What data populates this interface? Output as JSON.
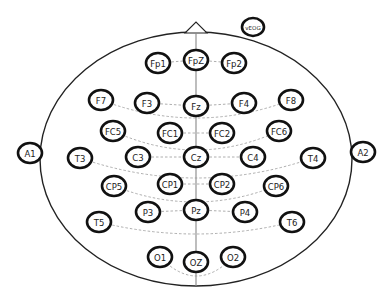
{
  "diagram": {
    "head": {
      "cx": 196,
      "cy": 159,
      "rx": 156,
      "ry": 127
    },
    "nose": {
      "apex": [
        196,
        22
      ],
      "left": [
        185,
        33
      ],
      "right": [
        207,
        33
      ]
    },
    "colors": {
      "ring": "#111111",
      "text": "#222222",
      "outline": "#222222",
      "connector": "#999999",
      "background": "#ffffff"
    },
    "electrodes": [
      {
        "id": "vEOG",
        "label": "vEOG",
        "x": 253,
        "y": 27,
        "rx": 11,
        "ry": 9,
        "small": true
      },
      {
        "id": "Fp1",
        "label": "Fp1",
        "x": 158,
        "y": 63
      },
      {
        "id": "FpZ",
        "label": "FpZ",
        "x": 196,
        "y": 60
      },
      {
        "id": "Fp2",
        "label": "Fp2",
        "x": 234,
        "y": 63
      },
      {
        "id": "F7",
        "label": "F7",
        "x": 101,
        "y": 100
      },
      {
        "id": "F3",
        "label": "F3",
        "x": 147,
        "y": 103
      },
      {
        "id": "Fz",
        "label": "Fz",
        "x": 196,
        "y": 106
      },
      {
        "id": "F4",
        "label": "F4",
        "x": 244,
        "y": 103
      },
      {
        "id": "F8",
        "label": "F8",
        "x": 291,
        "y": 100
      },
      {
        "id": "FC5",
        "label": "FC5",
        "x": 113,
        "y": 131
      },
      {
        "id": "FC1",
        "label": "FC1",
        "x": 170,
        "y": 133
      },
      {
        "id": "FC2",
        "label": "FC2",
        "x": 222,
        "y": 133
      },
      {
        "id": "FC6",
        "label": "FC6",
        "x": 279,
        "y": 131
      },
      {
        "id": "A1",
        "label": "A1",
        "x": 30,
        "y": 153
      },
      {
        "id": "T3",
        "label": "T3",
        "x": 80,
        "y": 158
      },
      {
        "id": "C3",
        "label": "C3",
        "x": 138,
        "y": 157
      },
      {
        "id": "Cz",
        "label": "Cz",
        "x": 196,
        "y": 157
      },
      {
        "id": "C4",
        "label": "C4",
        "x": 253,
        "y": 157
      },
      {
        "id": "T4",
        "label": "T4",
        "x": 313,
        "y": 158
      },
      {
        "id": "A2",
        "label": "A2",
        "x": 363,
        "y": 152
      },
      {
        "id": "CP5",
        "label": "CP5",
        "x": 114,
        "y": 186
      },
      {
        "id": "CP1",
        "label": "CP1",
        "x": 170,
        "y": 184
      },
      {
        "id": "CP2",
        "label": "CP2",
        "x": 222,
        "y": 184
      },
      {
        "id": "CP6",
        "label": "CP6",
        "x": 276,
        "y": 186
      },
      {
        "id": "P3",
        "label": "P3",
        "x": 148,
        "y": 212
      },
      {
        "id": "Pz",
        "label": "Pz",
        "x": 196,
        "y": 210
      },
      {
        "id": "P4",
        "label": "P4",
        "x": 245,
        "y": 212
      },
      {
        "id": "T5",
        "label": "T5",
        "x": 99,
        "y": 222
      },
      {
        "id": "T6",
        "label": "T6",
        "x": 292,
        "y": 222
      },
      {
        "id": "O1",
        "label": "O1",
        "x": 160,
        "y": 257
      },
      {
        "id": "OZ",
        "label": "OZ",
        "x": 196,
        "y": 262
      },
      {
        "id": "O2",
        "label": "O2",
        "x": 233,
        "y": 257
      }
    ],
    "straight_links": [
      [
        "Fp1",
        "FpZ"
      ],
      [
        "FpZ",
        "Fp2"
      ],
      [
        "F3",
        "Fz"
      ],
      [
        "Fz",
        "F4"
      ],
      [
        "FC1",
        "FC2"
      ],
      [
        "C3",
        "Cz"
      ],
      [
        "Cz",
        "C4"
      ],
      [
        "CP1",
        "CP2"
      ],
      [
        "P3",
        "Pz"
      ],
      [
        "Pz",
        "P4"
      ]
    ],
    "curved_links": [
      {
        "from": "F7",
        "to": "F8",
        "sag": 118
      },
      {
        "from": "FC5",
        "to": "FC6",
        "sag": 150
      },
      {
        "from": "T3",
        "to": "T4",
        "sag": 178
      },
      {
        "from": "CP5",
        "to": "CP6",
        "sag": 202
      },
      {
        "from": "T5",
        "to": "T6",
        "sag": 234
      },
      {
        "from": "O1",
        "to": "O2",
        "sag": 276
      }
    ]
  }
}
